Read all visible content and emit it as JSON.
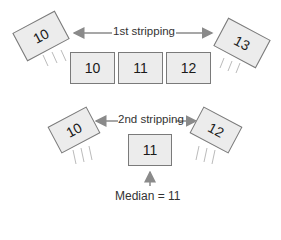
{
  "diagram": {
    "first_stripping": {
      "label": "1st stripping",
      "removed_left": "10",
      "removed_right": "13",
      "remaining": [
        "10",
        "11",
        "12"
      ]
    },
    "second_stripping": {
      "label": "2nd stripping",
      "removed_left": "10",
      "removed_right": "12",
      "remaining": [
        "11"
      ]
    },
    "result": {
      "label": "Median = 11"
    },
    "colors": {
      "card_fill": "#ececec",
      "card_border": "#7a7a7a",
      "arrow": "#8a8a8a"
    }
  }
}
